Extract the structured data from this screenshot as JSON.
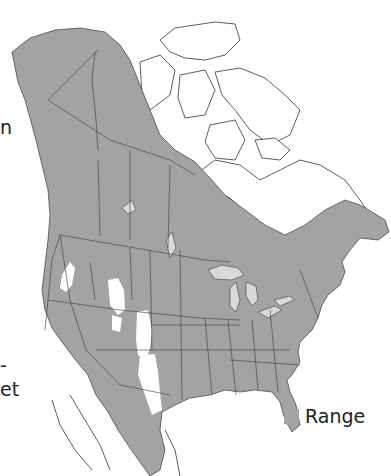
{
  "map": {
    "subject": "North America species range map",
    "range_color": "#a3a3a3",
    "unshaded_color": "#ffffff",
    "border_color": "#3a3a3a",
    "water_color": "#d9d9d9"
  },
  "legend": {
    "items": [
      {
        "label": "Range",
        "color": "#a3a3a3"
      }
    ]
  },
  "cropped_text_fragments": [
    {
      "text": "n"
    },
    {
      "text": "-"
    },
    {
      "text": "et"
    }
  ]
}
